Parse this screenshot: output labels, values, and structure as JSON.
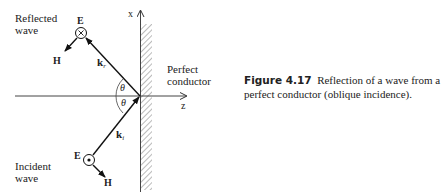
{
  "diagram": {
    "axes": {
      "x_label": "x",
      "z_label": "z"
    },
    "reflected": {
      "label_line1": "Reflected",
      "label_line2": "wave",
      "e_label": "E",
      "e_symbol": "into-page (⊗)",
      "h_label": "H",
      "k_label": "k",
      "k_sub": "r"
    },
    "incident": {
      "label_line1": "Incident",
      "label_line2": "wave",
      "e_label": "E",
      "e_symbol": "out-of-page (⊙)",
      "h_label": "H",
      "k_label": "k",
      "k_sub": "i"
    },
    "angles": {
      "upper": "θ",
      "lower": "θ"
    },
    "conductor": {
      "label_line1": "Perfect",
      "label_line2": "conductor"
    }
  },
  "caption": {
    "figure_number": "Figure 4.17",
    "text": "Reflection of a wave from a perfect conductor (oblique incidence)."
  }
}
